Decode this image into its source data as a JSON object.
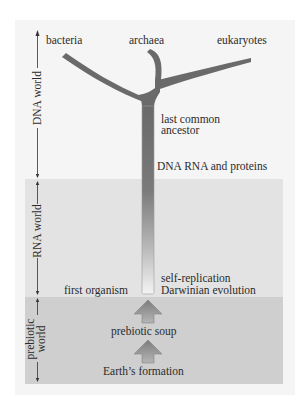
{
  "diagram": {
    "type": "evolution-timeline-tree",
    "branches": {
      "bacteria": "bacteria",
      "archaea": "archaea",
      "eukaryotes": "eukaryotes"
    },
    "stem_labels": {
      "last_common_ancestor_line1": "last common",
      "last_common_ancestor_line2": "ancestor",
      "dna_rna_proteins": "DNA RNA and proteins",
      "self_replication": "self-replication",
      "darwinian_evolution": "Darwinian evolution",
      "first_organism": "first organism"
    },
    "prebiotic_steps": {
      "prebiotic_soup": "prebiotic soup",
      "earths_formation": "Earth’s formation"
    },
    "eras": {
      "dna_world": "DNA world",
      "rna_world": "RNA world",
      "prebiotic_world_line1": "prebiotic",
      "prebiotic_world_line2": "world"
    },
    "colors": {
      "panel": "#f5f5f5",
      "rna_band": "#e3e3e3",
      "prebiotic_band": "#cfcfcf",
      "tree": "#6a6a6a",
      "stem_bottom": "#f4f4f4",
      "arrow": "#8a8a8a"
    }
  }
}
